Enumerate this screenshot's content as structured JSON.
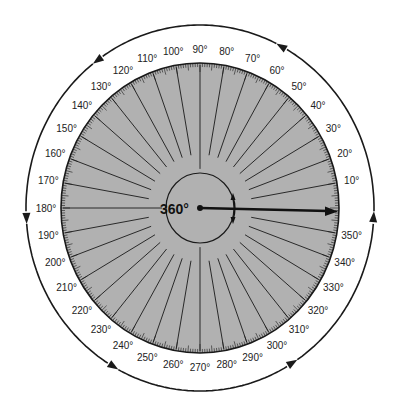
{
  "diagram": {
    "type": "protractor-rotation",
    "center_label": "360°",
    "disc_color": "#b1b1b1",
    "line_color": "#1a1a1a",
    "degree_labels": [
      "0°",
      "10°",
      "20°",
      "30°",
      "40°",
      "50°",
      "60°",
      "70°",
      "80°",
      "90°",
      "100°",
      "110°",
      "120°",
      "130°",
      "140°",
      "150°",
      "160°",
      "170°",
      "180°",
      "190°",
      "200°",
      "210°",
      "220°",
      "230°",
      "240°",
      "250°",
      "260°",
      "270°",
      "280°",
      "290°",
      "300°",
      "310°",
      "320°",
      "330°",
      "340°",
      "350°"
    ],
    "label_step_degrees": 10,
    "shown_labels_start": 10,
    "spoke_step_degrees": 10,
    "tick_minor_degrees": 1,
    "tick_mid_degrees": 5,
    "rotation_arrow": {
      "from_deg": 0,
      "direction": "counterclockwise",
      "to_deg": 360
    },
    "outer_arrow_positions_deg": [
      357,
      62,
      126,
      183,
      240,
      302
    ]
  }
}
